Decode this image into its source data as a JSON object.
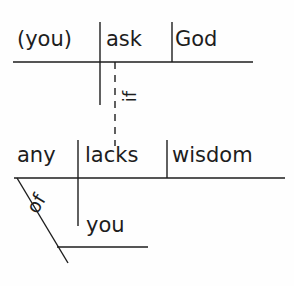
{
  "diagram": {
    "type": "reed-kellogg-sentence-diagram",
    "sentence": "If any of you lacks wisdom, (you) ask God.",
    "ink_color": "#1d1d1d",
    "background_color": "#fefefe",
    "main_clause": {
      "subject": "(you)",
      "verb": "ask",
      "direct_object": "God"
    },
    "subordinate_clause": {
      "subject": "any",
      "verb": "lacks",
      "direct_object": "wisdom"
    },
    "conjunction": {
      "word": "if",
      "line_style": "dashed",
      "orientation": "vertical"
    },
    "prepositional_phrase": {
      "preposition": "of",
      "object": "you",
      "line_style": "diagonal"
    },
    "words": {
      "you_subject": "(you)",
      "ask": "ask",
      "god": "God",
      "any": "any",
      "lacks": "lacks",
      "wisdom": "wisdom",
      "if": "if",
      "of": "of",
      "you_object": "you"
    }
  }
}
